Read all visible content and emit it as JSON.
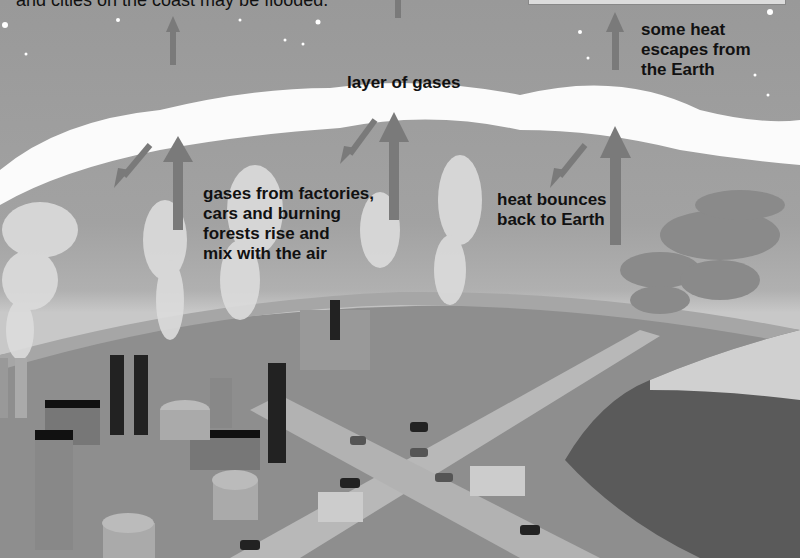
{
  "diagram": {
    "top_caption": "and cities on the coast may be flooded.",
    "labels": {
      "heat_escapes": "some heat\nescapes from\nthe Earth",
      "layer": "layer of gases",
      "gases_rise": "gases from factories,\ncars and burning\nforests rise and\nmix with the air",
      "heat_bounces": "heat bounces\nback to Earth"
    },
    "elements": [
      "sky with stars",
      "layer of gases cloud band",
      "upward heat arrows",
      "downward reflected arrows",
      "factories with chimneys",
      "smoke plumes",
      "roads with cars and trucks",
      "burning forest"
    ],
    "colors": {
      "sky": "#9a9a9a",
      "cloud": "#ffffff",
      "ground": "#8f8f8f",
      "road": "#b5b5b5",
      "arrow": "#7a7a7a",
      "chimney": "#222222",
      "forest": "#5a5a5a"
    }
  }
}
